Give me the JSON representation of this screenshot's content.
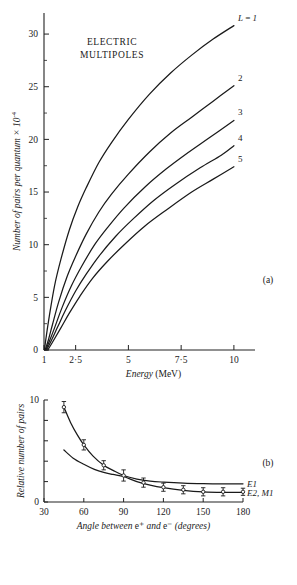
{
  "figure": {
    "panel_a_label": "(a)",
    "panel_b_label": "(b)"
  },
  "chart_data": [
    {
      "type": "line",
      "panel": "(a)",
      "title": "ELECTRIC MULTIPOLES",
      "title_line1": "ELECTRIC",
      "title_line2": "MULTIPOLES",
      "xlabel": "Energy (MeV)",
      "xlabel_italic": "Energy",
      "xlabel_unit": "(MeV)",
      "ylabel": "Number of pairs per quantum × 10⁻⁴",
      "ylabel_main": "Number of pairs per quantum × 10",
      "ylabel_exponent": "-4",
      "xlim": [
        1,
        11
      ],
      "ylim": [
        0,
        32
      ],
      "xticks": [
        1,
        2.5,
        5,
        7.5,
        10
      ],
      "xticklabels": [
        "1",
        "2·5",
        "5",
        "7·5",
        "10"
      ],
      "yticks": [
        0,
        5,
        10,
        15,
        20,
        25,
        30
      ],
      "yticklabels": [
        "0",
        "5",
        "10",
        "15",
        "20",
        "25",
        "30"
      ],
      "grid": false,
      "legend_position": "inline-right-of-curves",
      "series": [
        {
          "name": "L=1",
          "label": "L = 1",
          "x": [
            1.02,
            1.1,
            1.25,
            1.5,
            1.8,
            2.2,
            2.6,
            3.0,
            3.6,
            4.2,
            5.0,
            6.0,
            7.0,
            8.0,
            9.0,
            10.0
          ],
          "y": [
            0.0,
            1.2,
            3.2,
            6.1,
            8.6,
            11.4,
            13.6,
            15.4,
            17.8,
            19.7,
            21.9,
            24.3,
            26.3,
            28.0,
            29.5,
            30.8
          ]
        },
        {
          "name": "L=2",
          "label": "2",
          "x": [
            1.05,
            1.2,
            1.4,
            1.7,
            2.1,
            2.5,
            3.0,
            3.6,
            4.2,
            5.0,
            6.0,
            7.0,
            8.0,
            9.0,
            10.0
          ],
          "y": [
            0.0,
            0.9,
            2.4,
            4.6,
            7.0,
            8.9,
            11.0,
            13.1,
            14.8,
            16.7,
            18.8,
            20.6,
            22.1,
            23.6,
            25.1
          ]
        },
        {
          "name": "L=3",
          "label": "3",
          "x": [
            1.08,
            1.25,
            1.5,
            1.85,
            2.3,
            2.8,
            3.4,
            4.0,
            4.8,
            5.8,
            6.8,
            7.8,
            8.8,
            10.0
          ],
          "y": [
            0.0,
            0.8,
            2.1,
            4.0,
            6.1,
            8.0,
            10.0,
            11.6,
            13.5,
            15.5,
            17.2,
            18.7,
            20.1,
            21.8
          ]
        },
        {
          "name": "L=4",
          "label": "4",
          "x": [
            1.12,
            1.35,
            1.65,
            2.0,
            2.5,
            3.0,
            3.6,
            4.4,
            5.2,
            6.2,
            7.2,
            8.4,
            9.4,
            10.0
          ],
          "y": [
            0.0,
            0.9,
            2.2,
            3.7,
            5.6,
            7.2,
            8.9,
            10.8,
            12.4,
            14.2,
            15.7,
            17.3,
            18.5,
            19.4
          ]
        },
        {
          "name": "L=5",
          "label": "5",
          "x": [
            1.18,
            1.45,
            1.8,
            2.2,
            2.7,
            3.3,
            4.0,
            4.8,
            5.8,
            6.8,
            8.0,
            9.0,
            10.0
          ],
          "y": [
            0.0,
            0.9,
            2.1,
            3.5,
            5.1,
            6.8,
            8.4,
            10.0,
            11.8,
            13.3,
            15.0,
            16.2,
            17.4
          ]
        }
      ]
    },
    {
      "type": "line",
      "panel": "(b)",
      "title": "",
      "xlabel": "Angle between e⁺ and e⁻ (degrees)",
      "xlabel_part1": "Angle between",
      "xlabel_eplus": "e⁺",
      "xlabel_and": "and",
      "xlabel_eminus": "e⁻",
      "xlabel_unit": "(degrees)",
      "ylabel": "Relative number of pairs",
      "xlim": [
        30,
        180
      ],
      "ylim": [
        0,
        10
      ],
      "xticks": [
        30,
        60,
        90,
        120,
        150,
        180
      ],
      "xticklabels": [
        "30",
        "60",
        "90",
        "120",
        "150",
        "180"
      ],
      "yticks": [
        0,
        2,
        4,
        6,
        8,
        10
      ],
      "yticklabels": [
        "0",
        "",
        "",
        "",
        "",
        "10"
      ],
      "grid": false,
      "legend_position": "right-end-of-curves",
      "series": [
        {
          "name": "E1",
          "label": "E1",
          "x": [
            45,
            50,
            55,
            60,
            67,
            75,
            82,
            90,
            100,
            110,
            120,
            135,
            150,
            165,
            180
          ],
          "y": [
            9.3,
            7.8,
            6.6,
            5.6,
            4.5,
            3.6,
            3.1,
            2.6,
            2.25,
            2.05,
            1.95,
            1.85,
            1.8,
            1.78,
            1.78
          ]
        },
        {
          "name": "E2,M1",
          "label": "E2, M1",
          "x": [
            45,
            52,
            60,
            68,
            75,
            82,
            90,
            100,
            110,
            120,
            135,
            150,
            165,
            180
          ],
          "y": [
            5.1,
            4.3,
            3.7,
            3.2,
            2.9,
            2.7,
            2.5,
            2.0,
            1.65,
            1.4,
            1.15,
            1.0,
            0.95,
            0.95
          ]
        }
      ],
      "data_points": [
        {
          "series": "E1",
          "x": 45,
          "y": 9.3,
          "yerr": 0.55
        },
        {
          "series": "E1",
          "x": 60,
          "y": 5.6,
          "yerr": 0.5
        },
        {
          "series": "E1",
          "x": 75,
          "y": 3.6,
          "yerr": 0.45
        },
        {
          "series": "E1",
          "x": 90,
          "y": 2.6,
          "yerr": 0.55
        },
        {
          "series": "E2,M1",
          "x": 105,
          "y": 1.9,
          "yerr": 0.45
        },
        {
          "series": "E2,M1",
          "x": 120,
          "y": 1.45,
          "yerr": 0.4
        },
        {
          "series": "E2,M1",
          "x": 135,
          "y": 1.2,
          "yerr": 0.4
        },
        {
          "series": "E2,M1",
          "x": 150,
          "y": 1.0,
          "yerr": 0.4
        },
        {
          "series": "E2,M1",
          "x": 165,
          "y": 1.0,
          "yerr": 0.4
        },
        {
          "series": "E2,M1",
          "x": 180,
          "y": 1.0,
          "yerr": 0.35
        }
      ]
    }
  ],
  "colors": {
    "ink": "#1a1a1a",
    "background": "#ffffff"
  }
}
